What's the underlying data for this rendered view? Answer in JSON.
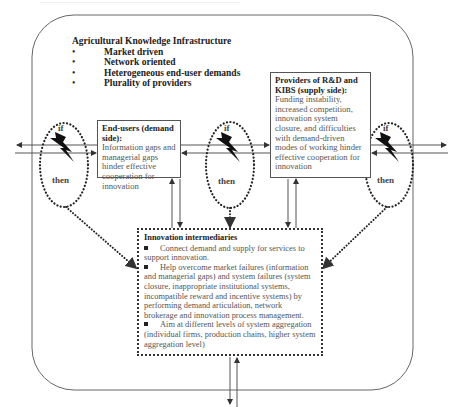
{
  "diagram": {
    "top_cropped_caption": "",
    "infrastructure": {
      "title": "Agricultural Knowledge Infrastructure",
      "bullets": [
        "Market driven",
        "Network oriented",
        "Heterogeneous end-user demands",
        "Plurality of providers"
      ]
    },
    "end_users": {
      "heading": "End-users (demand side):",
      "body": "Information gaps and managerial gaps hinder effective cooperation for innovation"
    },
    "providers": {
      "heading": "Providers of R&D and KIBS (supply side):",
      "body": "Funding instability, increased competition, innovation system closure, and difficulties with demand-driven modes of working hinder effective cooperation for innovation"
    },
    "intermediaries": {
      "heading": "Innovation intermediaries",
      "items": [
        "Connect demand and supply for services to support innovation.",
        "Help overcome market failures (information and managerial gaps) and system failures (system closure, inappropriate institutional systems, incompatible reward and incentive systems) by performing demand articulation, network brokerage and innovation process management.",
        "Aim at different levels of system aggregation (individual firms, production chains, higher system aggregation level)"
      ]
    },
    "conditions": [
      {
        "position": "left",
        "if_label": "if",
        "then_label": "then",
        "icon": "lightning-bolt-icon"
      },
      {
        "position": "middle",
        "if_label": "if",
        "then_label": "then",
        "icon": "lightning-bolt-icon"
      },
      {
        "position": "right",
        "if_label": "if",
        "then_label": "then",
        "icon": "lightning-bolt-icon"
      }
    ],
    "colors": {
      "line": "#555555",
      "dotted": "#333333",
      "heading_text": "#222222",
      "body_text": "#555555",
      "bolt": "#111111"
    }
  }
}
